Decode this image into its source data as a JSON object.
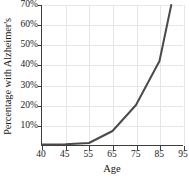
{
  "chart_data": {
    "type": "line",
    "title": "",
    "xlabel": "Age",
    "ylabel": "Percentage with Alzheimer's",
    "x": [
      40,
      45,
      55,
      65,
      75,
      85,
      90
    ],
    "values": [
      0.3,
      0.4,
      1.0,
      7.0,
      20.0,
      42.0,
      70.0
    ],
    "x_tick_labels": [
      "40",
      "45",
      "55",
      "65",
      "75",
      "85",
      "95"
    ],
    "x_tick_values": [
      40,
      45,
      55,
      65,
      75,
      85,
      95
    ],
    "y_tick_labels": [
      "10%",
      "20%",
      "30%",
      "40%",
      "50%",
      "60%",
      "70%"
    ],
    "y_tick_values": [
      10,
      20,
      30,
      40,
      50,
      60,
      70
    ],
    "ylim": [
      0,
      70
    ],
    "grid": true,
    "legend": "none",
    "line_color": "#4a4a4a",
    "grid_color": "#e6e6e6",
    "axis_color": "#3d3d3d"
  }
}
